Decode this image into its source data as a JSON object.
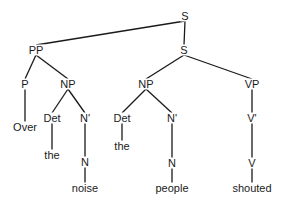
{
  "diagram": {
    "type": "syntax-tree",
    "nodes": [
      {
        "id": "s_top",
        "label": "S",
        "x": 185,
        "y": 16
      },
      {
        "id": "s_low",
        "label": "S",
        "x": 184,
        "y": 50
      },
      {
        "id": "pp",
        "label": "PP",
        "x": 36,
        "y": 50
      },
      {
        "id": "p",
        "label": "P",
        "x": 25,
        "y": 84
      },
      {
        "id": "over",
        "label": "Over",
        "x": 25,
        "y": 127
      },
      {
        "id": "np1",
        "label": "NP",
        "x": 68,
        "y": 84
      },
      {
        "id": "det1",
        "label": "Det",
        "x": 52,
        "y": 118
      },
      {
        "id": "the1",
        "label": "the",
        "x": 52,
        "y": 155
      },
      {
        "id": "nbar1",
        "label": "N'",
        "x": 85,
        "y": 118
      },
      {
        "id": "n1",
        "label": "N",
        "x": 85,
        "y": 162
      },
      {
        "id": "noise",
        "label": "noise",
        "x": 85,
        "y": 188
      },
      {
        "id": "np2",
        "label": "NP",
        "x": 146,
        "y": 84
      },
      {
        "id": "det2",
        "label": "Det",
        "x": 122,
        "y": 118
      },
      {
        "id": "the2",
        "label": "the",
        "x": 122,
        "y": 146
      },
      {
        "id": "nbar2",
        "label": "N'",
        "x": 172,
        "y": 118
      },
      {
        "id": "n2",
        "label": "N",
        "x": 172,
        "y": 163
      },
      {
        "id": "people",
        "label": "people",
        "x": 172,
        "y": 188
      },
      {
        "id": "vp",
        "label": "VP",
        "x": 252,
        "y": 84
      },
      {
        "id": "vbar",
        "label": "V'",
        "x": 252,
        "y": 118
      },
      {
        "id": "v",
        "label": "V",
        "x": 252,
        "y": 163
      },
      {
        "id": "shouted",
        "label": "shouted",
        "x": 252,
        "y": 188
      }
    ],
    "edges": [
      [
        "s_top",
        "pp"
      ],
      [
        "s_top",
        "s_low"
      ],
      [
        "pp",
        "p"
      ],
      [
        "pp",
        "np1"
      ],
      [
        "p",
        "over"
      ],
      [
        "np1",
        "det1"
      ],
      [
        "np1",
        "nbar1"
      ],
      [
        "det1",
        "the1"
      ],
      [
        "nbar1",
        "n1"
      ],
      [
        "n1",
        "noise"
      ],
      [
        "s_low",
        "np2"
      ],
      [
        "s_low",
        "vp"
      ],
      [
        "np2",
        "det2"
      ],
      [
        "np2",
        "nbar2"
      ],
      [
        "det2",
        "the2"
      ],
      [
        "nbar2",
        "n2"
      ],
      [
        "n2",
        "people"
      ],
      [
        "vp",
        "vbar"
      ],
      [
        "vbar",
        "v"
      ],
      [
        "v",
        "shouted"
      ]
    ]
  }
}
